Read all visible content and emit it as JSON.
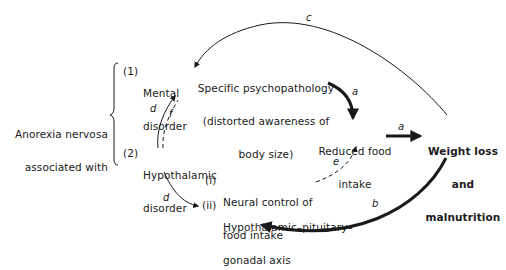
{
  "diagram": {
    "root": {
      "line1": "Anorexia nervosa",
      "line2": "associated with"
    },
    "mental": {
      "num": "(1)",
      "line1": "Mental",
      "line2": "disorder"
    },
    "hypo": {
      "num": "(2)",
      "line1": "Hypothalamic",
      "line2": "disorder"
    },
    "psycho": {
      "line1": "Specific psychopathology",
      "line2": "(distorted awareness of",
      "line3": "body size)"
    },
    "reduced": {
      "line1": "Reduced food",
      "line2": "intake"
    },
    "weight": {
      "line1": "Weight loss",
      "line2": "and",
      "line3": "malnutrition"
    },
    "neural": {
      "num": "(i)",
      "line1": "Neural control of",
      "line2": "food intake"
    },
    "axis": {
      "num": "(ii)",
      "line1": "Hypothalamic–pituitary–",
      "line2": "gonadal axis"
    },
    "arrow_labels": {
      "psycho_to_reduced": "a",
      "reduced_to_weight": "a",
      "weight_to_axis": "b",
      "weight_to_psycho": "c",
      "hypo_to_mental": "d",
      "hypo_to_axis": "d",
      "neural_to_reduced": "e",
      "hypo_to_mental_dashed": "f"
    }
  }
}
